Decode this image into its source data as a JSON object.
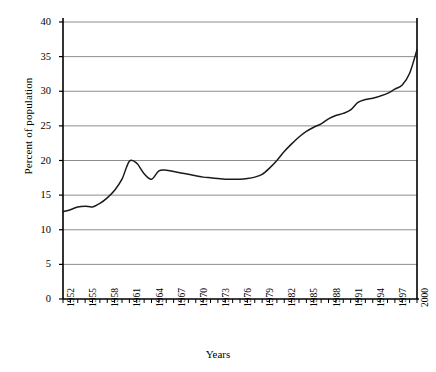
{
  "chart_data": {
    "type": "line",
    "title": "",
    "xlabel": "Years",
    "ylabel": "Percent of population",
    "xlim": [
      1952,
      2000
    ],
    "ylim": [
      0,
      40
    ],
    "ytick_values": [
      0,
      5,
      10,
      15,
      20,
      25,
      30,
      35,
      40
    ],
    "ytick_labels": [
      "0",
      "5",
      "10",
      "15",
      "20",
      "25",
      "30",
      "35",
      "40"
    ],
    "xtick_labels": [
      "1952",
      "1955",
      "1958",
      "1961",
      "1964",
      "1967",
      "1970",
      "1973",
      "1976",
      "1979",
      "1982",
      "1985",
      "1988",
      "1991",
      "1994",
      "1997",
      "2000"
    ],
    "xtick_years": [
      1952,
      1955,
      1958,
      1961,
      1964,
      1967,
      1970,
      1973,
      1976,
      1979,
      1982,
      1985,
      1988,
      1991,
      1994,
      1997,
      2000
    ],
    "grid": "horizontal",
    "legend": "none",
    "line_color": "#1a1a1a",
    "grid_color": "#8c8c8c",
    "axis_color": "#000000",
    "x": [
      1952,
      1953,
      1954,
      1955,
      1956,
      1957,
      1958,
      1959,
      1960,
      1961,
      1962,
      1963,
      1964,
      1965,
      1966,
      1967,
      1968,
      1969,
      1970,
      1971,
      1972,
      1973,
      1974,
      1975,
      1976,
      1977,
      1978,
      1979,
      1980,
      1981,
      1982,
      1983,
      1984,
      1985,
      1986,
      1987,
      1988,
      1989,
      1990,
      1991,
      1992,
      1993,
      1994,
      1995,
      1996,
      1997,
      1998,
      1999,
      2000
    ],
    "values": [
      12.6,
      12.9,
      13.3,
      13.4,
      13.3,
      13.8,
      14.6,
      15.7,
      17.3,
      19.9,
      19.6,
      18.1,
      17.3,
      18.5,
      18.6,
      18.4,
      18.2,
      18.0,
      17.8,
      17.6,
      17.5,
      17.4,
      17.3,
      17.3,
      17.3,
      17.4,
      17.6,
      18.0,
      18.9,
      20.0,
      21.3,
      22.4,
      23.4,
      24.2,
      24.8,
      25.3,
      26.0,
      26.5,
      26.8,
      27.3,
      28.4,
      28.8,
      29.0,
      29.3,
      29.7,
      30.3,
      30.9,
      32.6,
      36.0
    ]
  }
}
